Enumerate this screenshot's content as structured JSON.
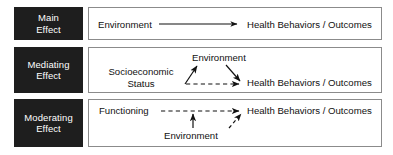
{
  "figure": {
    "background_color": "#ffffff",
    "chip_color": "#1e1e1e",
    "chip_text_color": "#ffffff",
    "panel_border_color": "#8b8b8b",
    "line_color": "#111111"
  },
  "rows": [
    {
      "id": "main",
      "label_line1": "Main",
      "label_line2": "Effect",
      "nodes": {
        "source": "Environment",
        "outcome": "Health Behaviors / Outcomes"
      },
      "connections": [
        {
          "from": "Environment",
          "to": "Health Behaviors / Outcomes",
          "style": "solid"
        }
      ]
    },
    {
      "id": "mediating",
      "label_line1": "Mediating",
      "label_line2": "Effect",
      "nodes": {
        "source_line1": "Socioeconomic",
        "source_line2": "Status",
        "mediator": "Environment",
        "outcome": "Health Behaviors / Outcomes"
      },
      "connections": [
        {
          "from": "Socioeconomic Status",
          "to": "Environment",
          "style": "solid"
        },
        {
          "from": "Environment",
          "to": "Health Behaviors / Outcomes",
          "style": "solid"
        },
        {
          "from": "Socioeconomic Status",
          "to": "Health Behaviors / Outcomes",
          "style": "dashed"
        }
      ]
    },
    {
      "id": "moderating",
      "label_line1": "Moderating",
      "label_line2": "Effect",
      "nodes": {
        "source": "Functioning",
        "moderator": "Environment",
        "outcome": "Health Behaviors / Outcomes"
      },
      "connections": [
        {
          "from": "Functioning",
          "to": "Health Behaviors / Outcomes",
          "style": "dashed"
        },
        {
          "from": "Environment",
          "to": "Functioning-Outcome path",
          "style": "solid"
        },
        {
          "from": "Environment",
          "to": "Health Behaviors / Outcomes",
          "style": "dashed"
        }
      ]
    }
  ]
}
